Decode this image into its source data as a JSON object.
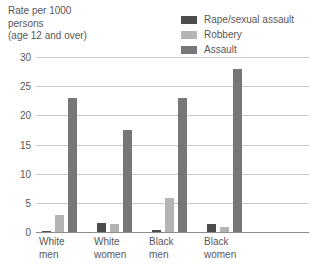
{
  "chart_data": {
    "type": "bar",
    "title": "",
    "ylabel": "Rate per 1000 persons (age 12 and over)",
    "xlabel": "",
    "ylim": [
      0,
      30
    ],
    "yticks": [
      0,
      5,
      10,
      15,
      20,
      25,
      30
    ],
    "grid": true,
    "legend_position": "top-right",
    "categories": [
      "White men",
      "White women",
      "Black men",
      "Black women"
    ],
    "series": [
      {
        "name": "Rape/sexual assault",
        "color": "#4d4d4f",
        "values": [
          0.2,
          1.5,
          0.3,
          1.3
        ]
      },
      {
        "name": "Robbery",
        "color": "#b4b4b6",
        "values": [
          3.0,
          1.3,
          5.8,
          0.8
        ]
      },
      {
        "name": "Assault",
        "color": "#77777a",
        "values": [
          23.0,
          17.5,
          23.0,
          28.0
        ]
      }
    ]
  },
  "axis_caption": "Rate per 1000\npersons\n(age 12 and over)",
  "category_labels": [
    "White\nmen",
    "White\nwomen",
    "Black\nmen",
    "Black\nwomen"
  ]
}
